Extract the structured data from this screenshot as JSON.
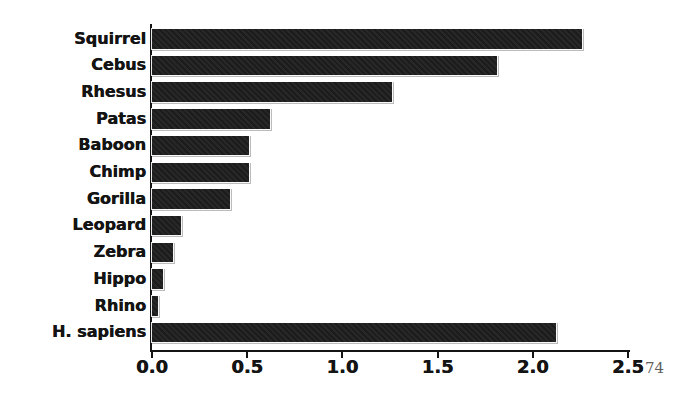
{
  "figure": {
    "background": "#ffffff",
    "bar_color": "#1c1c1c",
    "axis_color": "#141414",
    "label_color": "#141414",
    "page_number": "74",
    "page_number_color": "#5f5f5f"
  },
  "chart_data": {
    "type": "bar",
    "orientation": "horizontal",
    "title": "",
    "xlabel": "",
    "ylabel": "",
    "categories": [
      "Squirrel",
      "Cebus",
      "Rhesus",
      "Patas",
      "Baboon",
      "Chimp",
      "Gorilla",
      "Leopard",
      "Zebra",
      "Hippo",
      "Rhino",
      "H. sapiens"
    ],
    "values": [
      2.26,
      1.81,
      1.26,
      0.62,
      0.51,
      0.51,
      0.41,
      0.15,
      0.11,
      0.06,
      0.03,
      2.12
    ],
    "xlim": [
      0,
      2.5
    ],
    "xticks": [
      "0.0",
      "0.5",
      "1.0",
      "1.5",
      "2.0",
      "2.5"
    ],
    "xtick_values": [
      0.0,
      0.5,
      1.0,
      1.5,
      2.0,
      2.5
    ],
    "grid": false,
    "legend": false
  }
}
